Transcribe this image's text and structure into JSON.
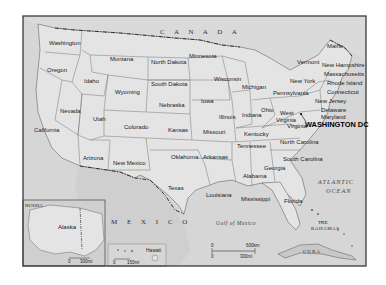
{
  "map": {
    "title": "United States",
    "colors": {
      "land_us": "#e2e2e2",
      "land_foreign": "#d0d0d0",
      "water": "#d9d9d9",
      "border": "#555555",
      "frame": "#3a3a3a"
    },
    "countries": {
      "canada": "C A N A D A",
      "mexico": "M E X I C O",
      "russia": "RUSSIA",
      "cuba": "CUBA",
      "bahamas_line1": "THE",
      "bahamas_line2": "BAHAMAS"
    },
    "water_bodies": {
      "atlantic_line1": "ATLANTIC",
      "atlantic_line2": "OCEAN",
      "gulf": "Gulf of Mexico"
    },
    "capital": "WASHINGTON DC",
    "states": [
      {
        "name": "Washington"
      },
      {
        "name": "Oregon"
      },
      {
        "name": "California"
      },
      {
        "name": "Idaho"
      },
      {
        "name": "Nevada"
      },
      {
        "name": "Montana"
      },
      {
        "name": "Wyoming"
      },
      {
        "name": "Utah"
      },
      {
        "name": "Arizona"
      },
      {
        "name": "Colorado"
      },
      {
        "name": "New Mexico"
      },
      {
        "name": "North Dakota"
      },
      {
        "name": "South Dakota"
      },
      {
        "name": "Nebraska"
      },
      {
        "name": "Kansas"
      },
      {
        "name": "Oklahoma"
      },
      {
        "name": "Texas"
      },
      {
        "name": "Minnesota"
      },
      {
        "name": "Iowa"
      },
      {
        "name": "Missouri"
      },
      {
        "name": "Arkansas"
      },
      {
        "name": "Louisiana"
      },
      {
        "name": "Wisconsin"
      },
      {
        "name": "Illinois"
      },
      {
        "name": "Michigan"
      },
      {
        "name": "Indiana"
      },
      {
        "name": "Ohio"
      },
      {
        "name": "Kentucky"
      },
      {
        "name": "Tennessee"
      },
      {
        "name": "Mississippi"
      },
      {
        "name": "Alabama"
      },
      {
        "name": "Georgia"
      },
      {
        "name": "Florida"
      },
      {
        "name": "South Carolina"
      },
      {
        "name": "North Carolina"
      },
      {
        "name": "Virginia"
      },
      {
        "name": "West Virginia"
      },
      {
        "name": "Pennsylvania"
      },
      {
        "name": "New York"
      },
      {
        "name": "Vermont"
      },
      {
        "name": "Maine"
      },
      {
        "name": "New Hampshire"
      },
      {
        "name": "Massachusetts"
      },
      {
        "name": "Rhode Island"
      },
      {
        "name": "Connecticut"
      },
      {
        "name": "New Jersey"
      },
      {
        "name": "Delaware"
      },
      {
        "name": "Maryland"
      },
      {
        "name": "Alaska"
      },
      {
        "name": "Hawaii"
      }
    ],
    "scale_main": {
      "zero_km": "0",
      "km": "600km",
      "zero_mi": "0",
      "mi": "300mi"
    },
    "scale_alaska": {
      "zero": "0",
      "mi": "300mi"
    },
    "scale_hawaii": {
      "zero": "0",
      "mi": "150mi"
    }
  }
}
